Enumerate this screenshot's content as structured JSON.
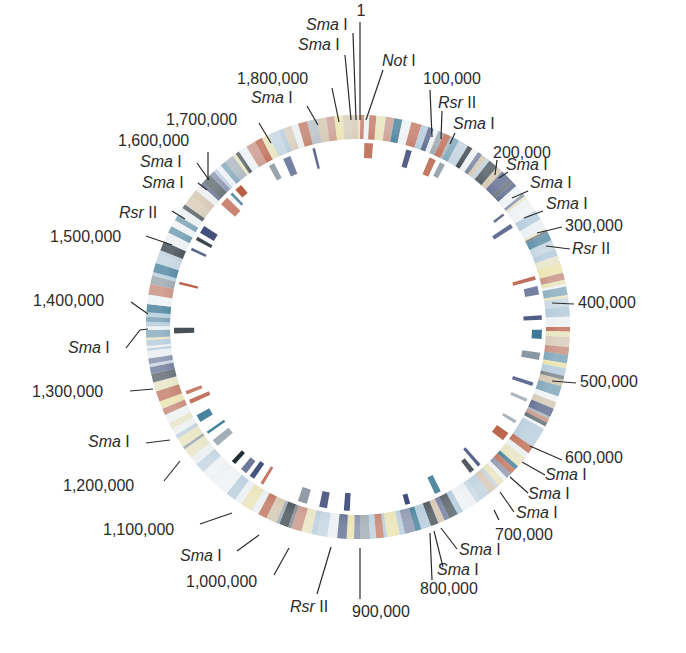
{
  "diagram": {
    "type": "circular-genome-map",
    "center": [
      358,
      327
    ],
    "outer_ring": {
      "r_outer": 212,
      "r_inner": 188
    },
    "inner_ticks": {
      "r_outer": 184,
      "r_inner": 160
    },
    "genome_length": 1830000,
    "colors": {
      "red": "#b4553a",
      "navy": "#3c4a78",
      "teal": "#2e6f8e",
      "dark": "#1e2a33",
      "yellow": "#e8dfa2",
      "pale_blue": "#a9c3d6",
      "grey": "#8b98a3",
      "beige": "#cdb89a",
      "white": "#eef2f4",
      "text": "#2b2b2b"
    },
    "position_labels": [
      {
        "text": "1",
        "pos": 0
      },
      {
        "text": "100,000",
        "pos": 100000
      },
      {
        "text": "200,000",
        "pos": 200000
      },
      {
        "text": "300,000",
        "pos": 300000
      },
      {
        "text": "400,000",
        "pos": 400000
      },
      {
        "text": "500,000",
        "pos": 500000
      },
      {
        "text": "600,000",
        "pos": 600000
      },
      {
        "text": "700,000",
        "pos": 700000
      },
      {
        "text": "800,000",
        "pos": 800000
      },
      {
        "text": "900,000",
        "pos": 900000
      },
      {
        "text": "1,000,000",
        "pos": 1000000
      },
      {
        "text": "1,100,000",
        "pos": 1100000
      },
      {
        "text": "1,200,000",
        "pos": 1200000
      },
      {
        "text": "1,300,000",
        "pos": 1300000
      },
      {
        "text": "1,400,000",
        "pos": 1400000
      },
      {
        "text": "1,500,000",
        "pos": 1500000
      },
      {
        "text": "1,600,000",
        "pos": 1600000
      },
      {
        "text": "1,700,000",
        "pos": 1700000
      },
      {
        "text": "1,800,000",
        "pos": 1800000
      }
    ],
    "restriction_sites": [
      {
        "enzyme": "Sma",
        "suffix": "I"
      },
      {
        "enzyme": "Not",
        "suffix": "I"
      },
      {
        "enzyme": "Rsr",
        "suffix": "II"
      }
    ],
    "labels": [
      {
        "id": "p1",
        "text": "1",
        "x": 361,
        "y": 16,
        "anchor": "middle",
        "line": [
          360,
          22,
          360,
          120
        ]
      },
      {
        "id": "sma-top1",
        "enz": "Sma",
        "suf": "I",
        "x": 306,
        "y": 30,
        "anchor": "start",
        "line": [
          353,
          33,
          356,
          120
        ]
      },
      {
        "id": "not1",
        "enz": "Not",
        "suf": "I",
        "x": 382,
        "y": 66,
        "anchor": "start",
        "line": [
          383,
          70,
          366,
          120
        ]
      },
      {
        "id": "sma-top2",
        "enz": "Sma",
        "suf": "I",
        "x": 298,
        "y": 50,
        "anchor": "start",
        "line": [
          345,
          55,
          351,
          120
        ]
      },
      {
        "id": "p1800",
        "text": "1,800,000",
        "x": 237,
        "y": 84,
        "anchor": "start",
        "line": [
          332,
          88,
          339,
          122
        ]
      },
      {
        "id": "sma-top3",
        "enz": "Sma",
        "suf": "I",
        "x": 251,
        "y": 103,
        "anchor": "start",
        "line": [
          307,
          106,
          318,
          125
        ]
      },
      {
        "id": "p1700",
        "text": "1,700,000",
        "x": 166,
        "y": 125,
        "anchor": "start",
        "line": [
          259,
          123,
          271,
          143
        ]
      },
      {
        "id": "p100",
        "text": "100,000",
        "x": 423,
        "y": 84,
        "anchor": "start",
        "line": [
          430,
          90,
          432,
          137
        ]
      },
      {
        "id": "rsr1",
        "enz": "Rsr",
        "suf": "II",
        "x": 438,
        "y": 108,
        "anchor": "start",
        "line": [
          442,
          111,
          441,
          139
        ]
      },
      {
        "id": "sma-r1",
        "enz": "Sma",
        "suf": "I",
        "x": 453,
        "y": 129,
        "anchor": "start",
        "line": [
          455,
          133,
          450,
          144
        ]
      },
      {
        "id": "p200",
        "text": "200,000",
        "x": 493,
        "y": 158,
        "anchor": "start",
        "line": [
          497,
          160,
          495,
          175
        ]
      },
      {
        "id": "sma-r2",
        "enz": "Sma",
        "suf": "I",
        "x": 506,
        "y": 170,
        "anchor": "start",
        "line": [
          508,
          172,
          499,
          178
        ]
      },
      {
        "id": "sma-r3",
        "enz": "Sma",
        "suf": "I",
        "x": 530,
        "y": 188,
        "anchor": "start",
        "line": [
          528,
          191,
          512,
          198
        ]
      },
      {
        "id": "sma-r4",
        "enz": "Sma",
        "suf": "I",
        "x": 546,
        "y": 209,
        "anchor": "start",
        "line": [
          543,
          211,
          524,
          218
        ]
      },
      {
        "id": "p300",
        "text": "300,000",
        "x": 565,
        "y": 231,
        "anchor": "start",
        "line": [
          562,
          227,
          537,
          233
        ]
      },
      {
        "id": "rsr2",
        "enz": "Rsr",
        "suf": "II",
        "x": 572,
        "y": 254,
        "anchor": "start",
        "line": [
          570,
          249,
          546,
          246
        ]
      },
      {
        "id": "p400",
        "text": "400,000",
        "x": 578,
        "y": 308,
        "anchor": "start",
        "line": [
          574,
          304,
          552,
          303
        ]
      },
      {
        "id": "p500",
        "text": "500,000",
        "x": 580,
        "y": 387,
        "anchor": "start",
        "line": [
          576,
          383,
          552,
          381
        ]
      },
      {
        "id": "p600",
        "text": "600,000",
        "x": 565,
        "y": 463,
        "anchor": "start",
        "line": [
          562,
          460,
          530,
          446
        ]
      },
      {
        "id": "sma-b1",
        "enz": "Sma",
        "suf": "I",
        "x": 545,
        "y": 480,
        "anchor": "start",
        "line": [
          545,
          475,
          522,
          462
        ]
      },
      {
        "id": "sma-b2",
        "enz": "Sma",
        "suf": "I",
        "x": 528,
        "y": 499,
        "anchor": "start",
        "line": [
          528,
          493,
          510,
          477
        ]
      },
      {
        "id": "sma-b3",
        "enz": "Sma",
        "suf": "I",
        "x": 516,
        "y": 518,
        "anchor": "start",
        "line": [
          514,
          512,
          500,
          492
        ]
      },
      {
        "id": "p700",
        "text": "700,000",
        "x": 495,
        "y": 540,
        "anchor": "start",
        "line": [
          499,
          520,
          494,
          510
        ]
      },
      {
        "id": "sma-b4",
        "enz": "Sma",
        "suf": "I",
        "x": 459,
        "y": 555,
        "anchor": "start",
        "line": [
          457,
          549,
          441,
          528
        ]
      },
      {
        "id": "sma-b5",
        "enz": "Sma",
        "suf": "I",
        "x": 437,
        "y": 575,
        "anchor": "start",
        "line": [
          443,
          567,
          434,
          531
        ]
      },
      {
        "id": "p800",
        "text": "800,000",
        "x": 420,
        "y": 594,
        "anchor": "start",
        "line": [
          432,
          580,
          430,
          533
        ]
      },
      {
        "id": "p900",
        "text": "900,000",
        "x": 352,
        "y": 617,
        "anchor": "start",
        "line": [
          360,
          599,
          360,
          548
        ]
      },
      {
        "id": "rsr3",
        "enz": "Rsr",
        "suf": "II",
        "x": 290,
        "y": 612,
        "anchor": "start",
        "line": [
          317,
          594,
          331,
          547
        ]
      },
      {
        "id": "p1000",
        "text": "1,000,000",
        "x": 186,
        "y": 587,
        "anchor": "start",
        "line": [
          274,
          575,
          289,
          548
        ]
      },
      {
        "id": "sma-l1",
        "enz": "Sma",
        "suf": "I",
        "x": 180,
        "y": 561,
        "anchor": "start",
        "line": [
          237,
          551,
          259,
          535
        ]
      },
      {
        "id": "p1100",
        "text": "1,100,000",
        "x": 103,
        "y": 535,
        "anchor": "start",
        "line": [
          200,
          524,
          232,
          513
        ]
      },
      {
        "id": "p1200",
        "text": "1,200,000",
        "x": 63,
        "y": 491,
        "anchor": "start",
        "line": [
          164,
          481,
          180,
          461
        ]
      },
      {
        "id": "sma-l2",
        "enz": "Sma",
        "suf": "I",
        "x": 88,
        "y": 447,
        "anchor": "start",
        "line": [
          146,
          443,
          170,
          440
        ]
      },
      {
        "id": "p1300",
        "text": "1,300,000",
        "x": 32,
        "y": 397,
        "anchor": "start",
        "line": [
          130,
          391,
          153,
          389
        ]
      },
      {
        "id": "sma-l3",
        "enz": "Sma",
        "suf": "I",
        "x": 68,
        "y": 353,
        "anchor": "start",
        "line": [
          126,
          348,
          140,
          330,
          148,
          329
        ]
      },
      {
        "id": "p1400",
        "text": "1,400,000",
        "x": 33,
        "y": 306,
        "anchor": "start",
        "line": [
          131,
          302,
          148,
          314
        ]
      },
      {
        "id": "p1500",
        "text": "1,500,000",
        "x": 50,
        "y": 242,
        "anchor": "start",
        "line": [
          146,
          236,
          172,
          245
        ]
      },
      {
        "id": "rsr4",
        "enz": "Rsr",
        "suf": "II",
        "x": 119,
        "y": 218,
        "anchor": "start",
        "line": [
          172,
          211,
          185,
          219
        ]
      },
      {
        "id": "sma-l4",
        "enz": "Sma",
        "suf": "I",
        "x": 142,
        "y": 188,
        "anchor": "start",
        "line": [
          198,
          183,
          207,
          190
        ]
      },
      {
        "id": "sma-l5",
        "enz": "Sma",
        "suf": "I",
        "x": 140,
        "y": 167,
        "anchor": "start",
        "line": [
          197,
          163,
          209,
          180
        ]
      },
      {
        "id": "p1600",
        "text": "1,600,000",
        "x": 118,
        "y": 146,
        "anchor": "start",
        "line": [
          208,
          152,
          208,
          180
        ]
      }
    ]
  }
}
